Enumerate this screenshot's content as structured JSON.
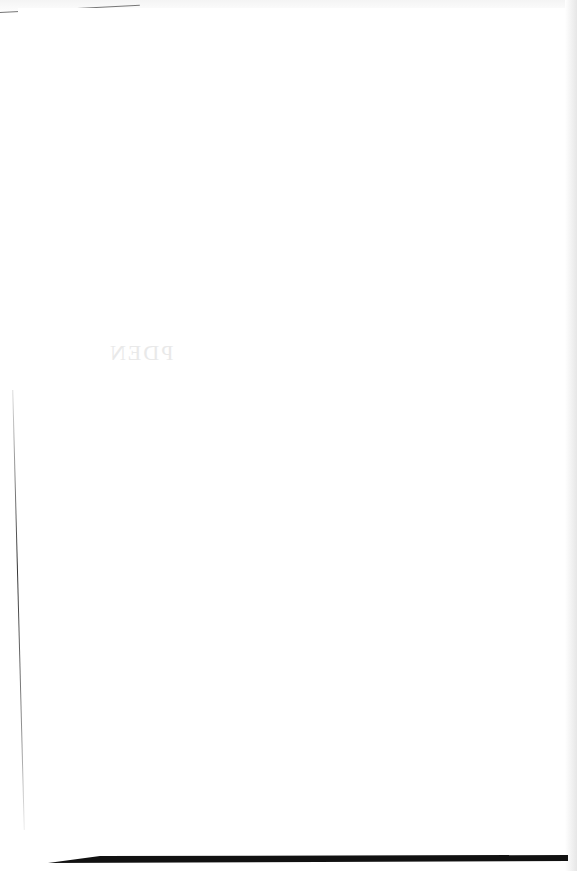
{
  "document": {
    "type": "scanned blank page",
    "bleed_through_text": "PDEN",
    "colors": {
      "paper": "#ffffff",
      "edge_shadow": "#111111",
      "bleed": "#e9e9e9"
    }
  }
}
